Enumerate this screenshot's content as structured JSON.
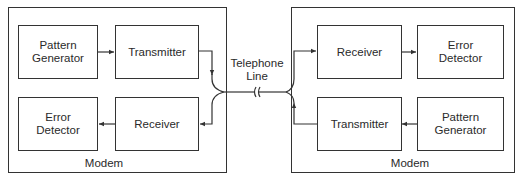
{
  "left_modem": {
    "label": "Modem",
    "blocks": {
      "pattern_generator": "Pattern\nGenerator",
      "transmitter": "Transmitter",
      "error_detector": "Error\nDetector",
      "receiver": "Receiver"
    }
  },
  "right_modem": {
    "label": "Modem",
    "blocks": {
      "receiver": "Receiver",
      "error_detector": "Error\nDetector",
      "transmitter": "Transmitter",
      "pattern_generator": "Pattern\nGenerator"
    }
  },
  "channel": {
    "label": "Telephone\nLine"
  },
  "colors": {
    "line": "#333333",
    "text": "#2a2a2a",
    "background": "#ffffff"
  }
}
